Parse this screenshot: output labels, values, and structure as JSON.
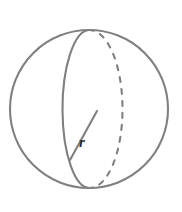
{
  "figure": {
    "name": "sphere-with-radius",
    "background_color": "#ffffff",
    "stroke_color": "#808080",
    "label_color": "#2b2b2b",
    "stroke_width": 2.1,
    "labels": {
      "radius": "r"
    },
    "geometry": {
      "circle": {
        "cx": 89,
        "cy": 109,
        "r": 79
      },
      "front_arc": {
        "description": "solid near-side great-circle arc bulging left",
        "start_x": 89,
        "start_y": 30,
        "end_x": 90,
        "end_y": 188,
        "rx": 27,
        "ry": 79,
        "style": "solid"
      },
      "back_arc": {
        "description": "dashed far-side great-circle arc bulging right",
        "start_x": 89,
        "start_y": 30,
        "end_x": 90,
        "end_y": 188,
        "rx": 33,
        "ry": 79,
        "style": "dashed",
        "dash_pattern": "5 7"
      },
      "radius_line": {
        "x1": 97,
        "y1": 111,
        "x2": 70,
        "y2": 160
      },
      "radius_label_position": {
        "x": 79,
        "y": 147
      }
    }
  }
}
